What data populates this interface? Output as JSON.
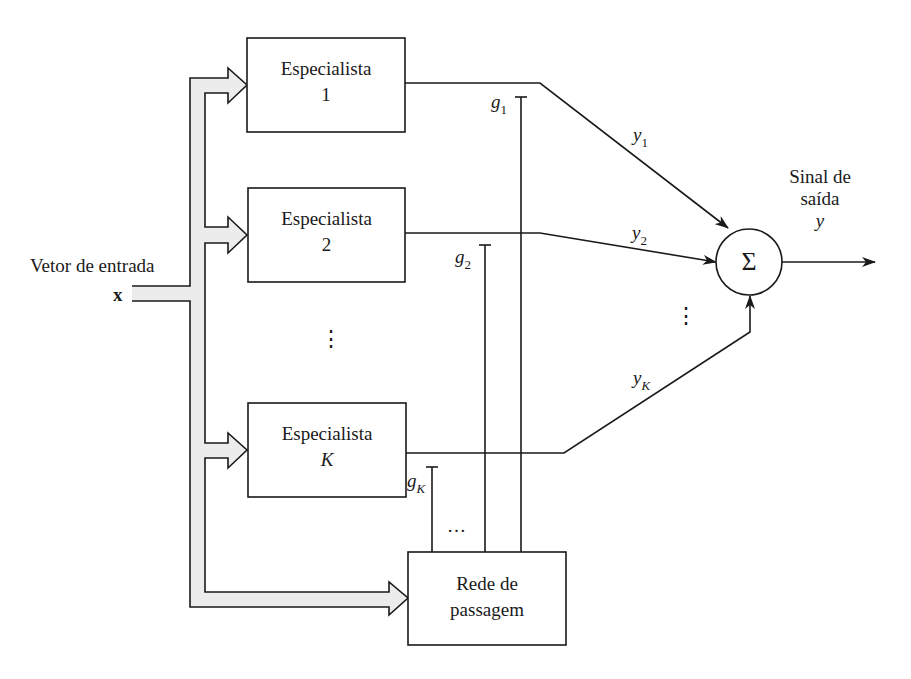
{
  "diagram": {
    "input": {
      "label": "Vetor de entrada",
      "symbol": "x"
    },
    "experts": [
      {
        "title": "Especialista",
        "index": "1",
        "output_var": "y",
        "output_sub": "1",
        "gate_var": "g",
        "gate_sub": "1"
      },
      {
        "title": "Especialista",
        "index": "2",
        "output_var": "y",
        "output_sub": "2",
        "gate_var": "g",
        "gate_sub": "2"
      },
      {
        "title": "Especialista",
        "index": "K",
        "output_var": "y",
        "output_sub": "K",
        "gate_var": "g",
        "gate_sub": "K"
      }
    ],
    "ellipsis_vertical": "⋮",
    "ellipsis_horizontal": "…",
    "gating_network": {
      "line1": "Rede de",
      "line2": "passagem"
    },
    "summation": {
      "symbol": "Σ"
    },
    "output": {
      "line1": "Sinal de",
      "line2": "saída",
      "symbol": "y"
    },
    "colors": {
      "stroke": "#1a1a1a",
      "bus_fill": "#ececec",
      "background": "#ffffff"
    }
  }
}
